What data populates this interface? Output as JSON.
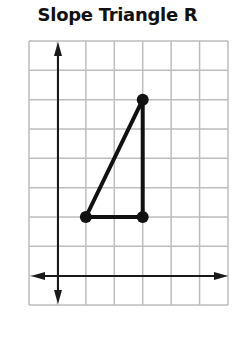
{
  "title": "Slope Triangle R",
  "colors": {
    "grid": "#bdbdbd",
    "axis": "#1a1a1a",
    "triangle": "#111111",
    "background": "#ffffff"
  },
  "chart_data": {
    "type": "diagram",
    "title": "Slope Triangle R",
    "grid": {
      "columns": 7,
      "rows": 9,
      "x_range": [
        -1,
        6
      ],
      "y_range": [
        -1,
        8
      ],
      "axes_origin": [
        0,
        0
      ]
    },
    "triangle": {
      "name": "R",
      "vertices": [
        {
          "label": "bottom-left",
          "x": 1,
          "y": 2
        },
        {
          "label": "bottom-right",
          "x": 3,
          "y": 2
        },
        {
          "label": "top",
          "x": 3,
          "y": 6
        }
      ],
      "run": 2,
      "rise": 4,
      "slope": 2
    }
  }
}
